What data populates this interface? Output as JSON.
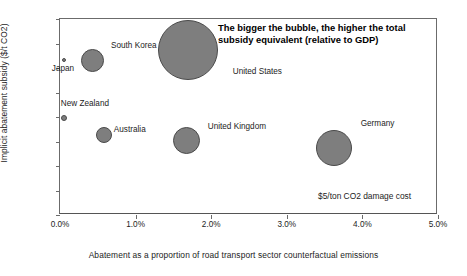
{
  "chart_data": {
    "type": "scatter",
    "title": "",
    "xlabel": "Abatement as a proportion of road transport sector counterfactual emissions",
    "ylabel": "Implicit abatement subsidy ($/t CO2)",
    "xlim": [
      0,
      5
    ],
    "ylim": [
      0,
      800
    ],
    "xticks": [
      "0.0%",
      "1.0%",
      "2.0%",
      "3.0%",
      "4.0%",
      "5.0%"
    ],
    "xtick_values": [
      0,
      1,
      2,
      3,
      4,
      5
    ],
    "yticks": [
      "0",
      "100",
      "200",
      "300",
      "400",
      "500",
      "600",
      "700",
      "800"
    ],
    "ytick_values": [
      0,
      100,
      200,
      300,
      400,
      500,
      600,
      700,
      800
    ],
    "grid": false,
    "legend": "none",
    "size_meaning": "The bigger the bubble, the higher the total subsidy equivalent (relative to GDP)",
    "points": [
      {
        "label": "Japan",
        "x": 0.05,
        "y": 632,
        "size": 4,
        "label_dx": -4,
        "label_dy": 9
      },
      {
        "label": "South Korea",
        "x": 0.43,
        "y": 631,
        "size": 23,
        "label_dx": 17,
        "label_dy": -14
      },
      {
        "label": "United States",
        "x": 1.69,
        "y": 675,
        "size": 60,
        "label_dx": 25,
        "label_dy": 22
      },
      {
        "label": "New Zealand",
        "x": 0.05,
        "y": 396,
        "size": 6,
        "label_dx": 4,
        "label_dy": -14
      },
      {
        "label": "Australia",
        "x": 0.58,
        "y": 328,
        "size": 16,
        "label_dx": 12,
        "label_dy": -5
      },
      {
        "label": "United Kingdom",
        "x": 1.67,
        "y": 303,
        "size": 27,
        "label_dx": 18,
        "label_dy": -14
      },
      {
        "label": "Germany",
        "x": 3.62,
        "y": 275,
        "size": 36,
        "label_dx": 19,
        "label_dy": -24
      }
    ],
    "annotations": [
      {
        "name": "bubble-size-callout",
        "text": "The bigger the bubble, the higher the total subsidy equivalent (relative to GDP)"
      },
      {
        "name": "damage-cost-note",
        "text": "$5/ton CO2 damage cost"
      }
    ],
    "colors": {
      "bubble_fill": "#7e7e7e",
      "bubble_stroke": "#4a4a4a",
      "axis": "#6b6b6b",
      "text": "#1c1c1c"
    }
  }
}
